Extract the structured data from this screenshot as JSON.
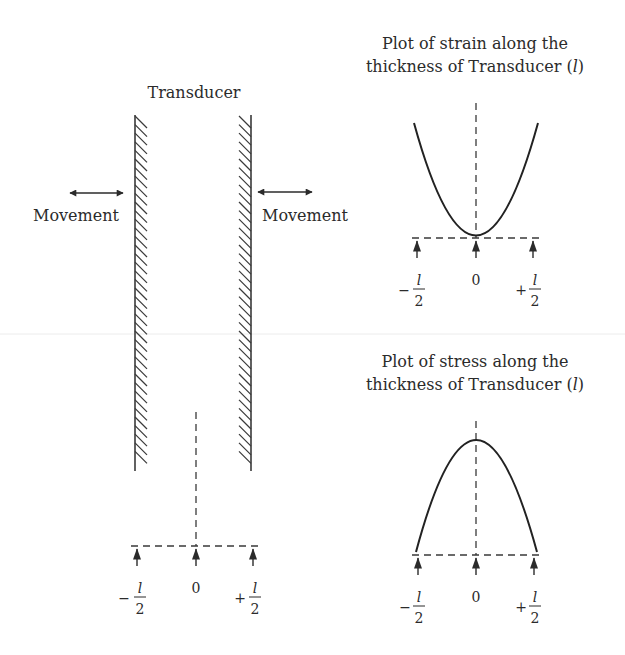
{
  "diagram": {
    "transducer": {
      "title": "Transducer",
      "left_movement_label": "Movement",
      "right_movement_label": "Movement",
      "axis": {
        "ticks": [
          {
            "sign": "−",
            "num": "l",
            "den": "2"
          },
          {
            "value": "0"
          },
          {
            "sign": "+",
            "num": "l",
            "den": "2"
          }
        ]
      }
    },
    "strain_plot": {
      "title_line1": "Plot of strain along the",
      "title_line2_prefix": "thickness of Transducer (",
      "title_line2_var": "l",
      "title_line2_suffix": ")",
      "shape": "upward parabola (minimum at center)",
      "axis": {
        "ticks": [
          {
            "sign": "−",
            "num": "l",
            "den": "2"
          },
          {
            "value": "0"
          },
          {
            "sign": "+",
            "num": "l",
            "den": "2"
          }
        ]
      }
    },
    "stress_plot": {
      "title_line1": "Plot of stress along the",
      "title_line2_prefix": "thickness of Transducer (",
      "title_line2_var": "l",
      "title_line2_suffix": ")",
      "shape": "downward parabola (maximum at center)",
      "axis": {
        "ticks": [
          {
            "sign": "−",
            "num": "l",
            "den": "2"
          },
          {
            "value": "0"
          },
          {
            "sign": "+",
            "num": "l",
            "den": "2"
          }
        ]
      }
    }
  },
  "colors": {
    "ink": "#2b2b2b",
    "background": "#ffffff"
  }
}
